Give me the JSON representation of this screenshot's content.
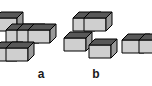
{
  "figure": {
    "background_color": "#ffffff",
    "width": 152,
    "height": 86,
    "cube": {
      "top_face_color": "#585858",
      "front_face_color": "#cfcfcf",
      "side_face_color": "#9a9a9a",
      "outline_color": "#000000",
      "outline_width": 1,
      "half_width": 11,
      "height": 13,
      "depth_rise": 6
    },
    "labels": [
      {
        "id": "label-a",
        "text": "a",
        "x": 41,
        "y": 74
      },
      {
        "id": "label-b",
        "text": "b",
        "x": 96,
        "y": 74
      }
    ],
    "groups": [
      {
        "name": "assembly-a",
        "label": "a",
        "cube_count": 5,
        "clipped_at_left_edge": true,
        "cubes": [
          {
            "cx": 6,
            "cy": 18,
            "order": 1
          },
          {
            "cx": 17,
            "cy": 30,
            "order": 2
          },
          {
            "cx": 28,
            "cy": 30,
            "order": 3
          },
          {
            "cx": 39,
            "cy": 30,
            "order": 4
          },
          {
            "cx": 6,
            "cy": 48,
            "order": 5
          },
          {
            "cx": 17,
            "cy": 48,
            "order": 6
          }
        ]
      },
      {
        "name": "assembly-b",
        "label": "b",
        "cube_count": 4,
        "clipped_at_left_edge": false,
        "cubes": [
          {
            "cx": 84,
            "cy": 18,
            "order": 1
          },
          {
            "cx": 95,
            "cy": 18,
            "order": 2
          },
          {
            "cx": 75,
            "cy": 38,
            "order": 3
          },
          {
            "cx": 100,
            "cy": 45,
            "order": 4
          }
        ]
      },
      {
        "name": "assembly-c-partial",
        "label": "",
        "cube_count": 2,
        "clipped_at_right_edge": true,
        "cubes": [
          {
            "cx": 133,
            "cy": 40,
            "order": 1
          },
          {
            "cx": 150,
            "cy": 40,
            "order": 2
          }
        ]
      }
    ]
  }
}
